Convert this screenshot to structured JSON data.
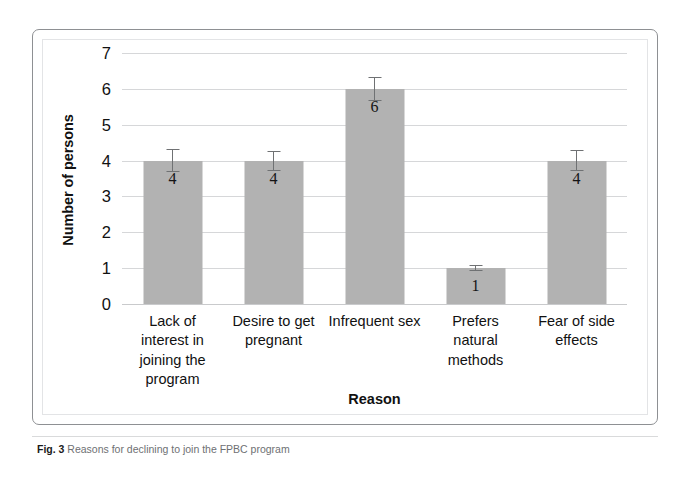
{
  "chart_data": {
    "type": "bar",
    "title": "",
    "xlabel": "Reason",
    "ylabel": "Number of persons",
    "categories": [
      "Lack of interest in joining the program",
      "Desire to get pregnant",
      "Infrequent sex",
      "Prefers natural methods",
      "Fear of side effects"
    ],
    "category_lines": [
      [
        "Lack of",
        "interest in",
        "joining the",
        "program"
      ],
      [
        "Desire to get",
        "pregnant"
      ],
      [
        "Infrequent sex"
      ],
      [
        "Prefers",
        "natural",
        "methods"
      ],
      [
        "Fear of side",
        "effects"
      ]
    ],
    "values": [
      4,
      4,
      6,
      1,
      4
    ],
    "data_labels": [
      "4",
      "4",
      "6",
      "1",
      "4"
    ],
    "errors": [
      0.32,
      0.28,
      0.34,
      0.09,
      0.3
    ],
    "ylim": [
      0,
      7
    ],
    "yticks": [
      0,
      1,
      2,
      3,
      4,
      5,
      6,
      7
    ],
    "ytick_labels": [
      "0",
      "1",
      "2",
      "3",
      "4",
      "5",
      "6",
      "7"
    ],
    "grid": true,
    "legend": "none",
    "bar_color": "#b2b2b2",
    "gridline_color": "#d6d7d9",
    "error_color": "#6f7173"
  },
  "caption": {
    "label": "Fig. 3",
    "text": "Reasons for declining to join the FPBC program"
  }
}
